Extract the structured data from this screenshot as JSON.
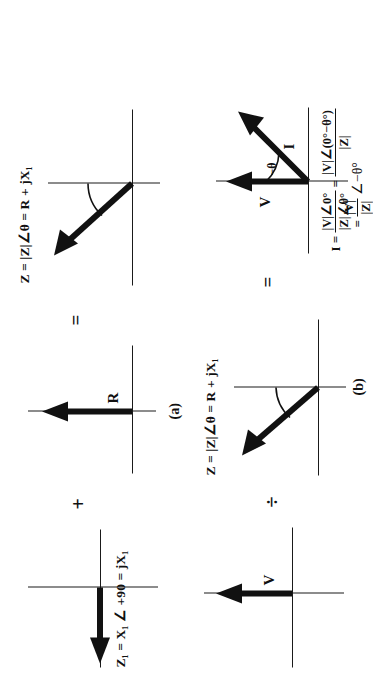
{
  "figure": {
    "orientation_note": "page scanned rotated 90 degrees",
    "rows": [
      {
        "id": "row-a",
        "caption": "(a)",
        "operator_1": "+",
        "operator_2": "=",
        "panels": [
          {
            "id": "panel-a1",
            "vector_label": "",
            "equation": "Z₁ = X₁ ∠ +90 = jX₁",
            "vector_direction": "left",
            "vector_name": "reactance-phasor"
          },
          {
            "id": "panel-a2",
            "vector_label": "R",
            "equation": "",
            "vector_direction": "up",
            "vector_name": "resistance-phasor"
          },
          {
            "id": "panel-a3",
            "vector_label": "",
            "equation": "Z = |Z|∠θ = R + jX₁",
            "vector_direction": "up-left",
            "vector_name": "impedance-phasor"
          }
        ]
      },
      {
        "id": "row-b",
        "caption": "(b)",
        "operator_1": "÷",
        "operator_2": "=",
        "panels": [
          {
            "id": "panel-b1",
            "vector_label": "V",
            "equation": "",
            "vector_direction": "up",
            "vector_name": "voltage-phasor"
          },
          {
            "id": "panel-b2",
            "vector_label": "",
            "equation": "Z = |Z|∠θ = R + jX₁",
            "vector_direction": "up-left",
            "vector_name": "impedance-phasor"
          },
          {
            "id": "panel-b3",
            "vector_label_v": "V",
            "vector_label_i": "I",
            "angle_label": "−θ",
            "vector_name": "current-phasor"
          }
        ]
      }
    ],
    "derivation": {
      "line1_lhs": "I =",
      "line1_num": "|V|∠0°",
      "line1_den": "|Z|∠θ°",
      "line1_eq": "=",
      "line2_num": "|V|∠(0°−θ°)",
      "line2_den": "|Z|",
      "line3_eq": "=",
      "line3_num": "|V|",
      "line3_den": "|Z|",
      "line3_tail": "∠−θ°"
    },
    "colors": {
      "ink": "#111111",
      "paper": "#ffffff"
    }
  }
}
